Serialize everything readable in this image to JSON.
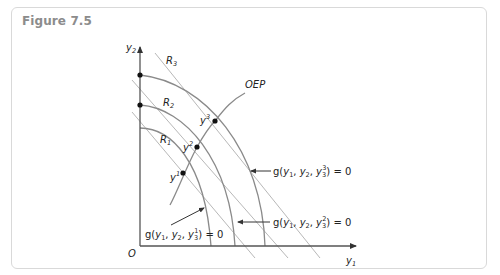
{
  "figure": {
    "title": "Figure 7.5"
  },
  "diagram": {
    "axes": {
      "origin_label": "O",
      "x_label": "y",
      "x_label_sub": "1",
      "y_label": "y",
      "y_label_sub": "2"
    },
    "revenue_lines": [
      {
        "label": "R",
        "sub": "1"
      },
      {
        "label": "R",
        "sub": "2"
      },
      {
        "label": "R",
        "sub": "3"
      }
    ],
    "points": [
      {
        "label": "y",
        "sup": "1"
      },
      {
        "label": "y",
        "sup": "2"
      },
      {
        "label": "y",
        "sup": "3"
      }
    ],
    "path_label": "OEP",
    "frontiers": [
      {
        "label": "g(y",
        "parts": [
          "1",
          ", y",
          "2",
          ", y",
          "3",
          "1"
        ],
        "text": "g(y1, y2, y3^1) = 0"
      },
      {
        "label": "g(y",
        "text": "g(y1, y2, y3^2) = 0"
      },
      {
        "label": "g(y",
        "text": "g(y1, y2, y3^3) = 0"
      }
    ],
    "colors": {
      "axis": "#555555",
      "curve": "#8a8a8a",
      "line": "#b5b5b5",
      "point": "#111111",
      "title": "#8c8c8c",
      "border": "#d9d9d9"
    }
  }
}
